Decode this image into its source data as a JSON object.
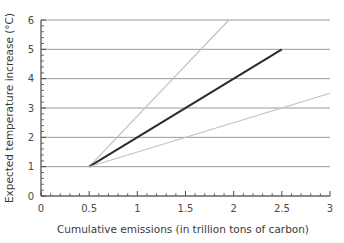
{
  "chart_data": {
    "type": "line",
    "title": "",
    "xlabel": "Cumulative emissions (in trillion tons of carbon)",
    "ylabel": "Expected temperature increase (°C)",
    "xlim": [
      0,
      3
    ],
    "ylim": [
      0,
      6
    ],
    "xticks": [
      "0",
      "0.5",
      "1",
      "1.5",
      "2",
      "2.5",
      "3"
    ],
    "xtick_values": [
      0,
      0.5,
      1,
      1.5,
      2,
      2.5,
      3
    ],
    "yticks": [
      "0",
      "1",
      "2",
      "3",
      "4",
      "5",
      "6"
    ],
    "ytick_values": [
      0,
      1,
      2,
      3,
      4,
      5,
      6
    ],
    "x_minor_step": 0.1,
    "y_minor_step": 0.2,
    "grid": "horizontal",
    "grid_color": "#9a9a9a",
    "legend": "none",
    "origin_point": [
      0.5,
      1
    ],
    "series": [
      {
        "name": "upper-bound",
        "color": "#c0c0c0",
        "width": 1.1,
        "points": [
          [
            0.5,
            1
          ],
          [
            1.95,
            6.0
          ]
        ]
      },
      {
        "name": "central-estimate",
        "color": "#2b2b2b",
        "width": 2.0,
        "points": [
          [
            0.5,
            1
          ],
          [
            2.5,
            5
          ]
        ]
      },
      {
        "name": "lower-bound",
        "color": "#c0c0c0",
        "width": 1.1,
        "points": [
          [
            0.5,
            1
          ],
          [
            3.0,
            3.5
          ]
        ]
      }
    ]
  },
  "colors": {
    "axis": "#4a4a4a",
    "grid": "#9a9a9a",
    "central_line": "#2b2b2b",
    "bound_line": "#c0c0c0",
    "background": "#ffffff"
  }
}
